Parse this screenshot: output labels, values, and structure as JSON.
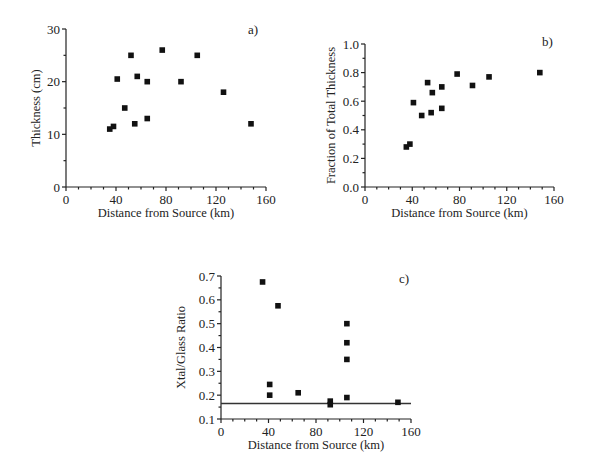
{
  "chart_data": [
    {
      "panel": "a)",
      "type": "scatter",
      "xlabel": "Distance from Source (km)",
      "ylabel": "Thickness (cm)",
      "xlim": [
        0,
        160
      ],
      "ylim": [
        0,
        30
      ],
      "xticks": [
        0,
        40,
        80,
        120,
        160
      ],
      "yticks": [
        0,
        10,
        20,
        30
      ],
      "grid": false,
      "points": [
        {
          "x": 35,
          "y": 11
        },
        {
          "x": 38,
          "y": 11.5
        },
        {
          "x": 41,
          "y": 20.5
        },
        {
          "x": 47,
          "y": 15
        },
        {
          "x": 52,
          "y": 25
        },
        {
          "x": 55,
          "y": 12
        },
        {
          "x": 57,
          "y": 21
        },
        {
          "x": 65,
          "y": 20
        },
        {
          "x": 65,
          "y": 13
        },
        {
          "x": 77,
          "y": 26
        },
        {
          "x": 92,
          "y": 20
        },
        {
          "x": 105,
          "y": 25
        },
        {
          "x": 126,
          "y": 18
        },
        {
          "x": 148,
          "y": 12
        }
      ]
    },
    {
      "panel": "b)",
      "type": "scatter",
      "xlabel": "Distance from Source (km)",
      "ylabel": "Fraction of Total Thickness",
      "xlim": [
        0,
        160
      ],
      "ylim": [
        0,
        1.0
      ],
      "xticks": [
        0,
        40,
        80,
        120,
        160
      ],
      "yticks": [
        "0.0",
        "0.2",
        "0.4",
        "0.6",
        "0.8",
        "1.0"
      ],
      "grid": false,
      "points": [
        {
          "x": 35,
          "y": 0.28
        },
        {
          "x": 38,
          "y": 0.3
        },
        {
          "x": 41,
          "y": 0.59
        },
        {
          "x": 48,
          "y": 0.5
        },
        {
          "x": 53,
          "y": 0.73
        },
        {
          "x": 56,
          "y": 0.52
        },
        {
          "x": 57,
          "y": 0.66
        },
        {
          "x": 65,
          "y": 0.7
        },
        {
          "x": 65,
          "y": 0.55
        },
        {
          "x": 78,
          "y": 0.79
        },
        {
          "x": 91,
          "y": 0.71
        },
        {
          "x": 105,
          "y": 0.77
        },
        {
          "x": 148,
          "y": 0.8
        }
      ]
    },
    {
      "panel": "c)",
      "type": "scatter",
      "xlabel": "Distance from Source (km)",
      "ylabel": "Xtal/Glass Ratio",
      "xlim": [
        0,
        160
      ],
      "ylim": [
        0.1,
        0.7
      ],
      "xticks": [
        0,
        40,
        80,
        120,
        160
      ],
      "yticks": [
        "0.1",
        "0.2",
        "0.3",
        "0.4",
        "0.5",
        "0.6",
        "0.7"
      ],
      "grid": false,
      "reference_line": {
        "y": 0.165,
        "x_from": 0,
        "x_to": 160
      },
      "points": [
        {
          "x": 35,
          "y": 0.675
        },
        {
          "x": 41,
          "y": 0.245
        },
        {
          "x": 41,
          "y": 0.2
        },
        {
          "x": 48,
          "y": 0.575
        },
        {
          "x": 65,
          "y": 0.21
        },
        {
          "x": 92,
          "y": 0.175
        },
        {
          "x": 92,
          "y": 0.16
        },
        {
          "x": 106,
          "y": 0.5
        },
        {
          "x": 106,
          "y": 0.42
        },
        {
          "x": 106,
          "y": 0.35
        },
        {
          "x": 106,
          "y": 0.19
        },
        {
          "x": 149,
          "y": 0.17
        }
      ]
    }
  ],
  "panels": [
    {
      "x0": 66,
      "x1": 266,
      "y0": 187,
      "y1": 29,
      "labelX": 248,
      "labelY": 34,
      "ylabelX": 40
    },
    {
      "x0": 365,
      "x1": 554,
      "y0": 187,
      "y1": 44,
      "labelX": 542,
      "labelY": 46,
      "ylabelX": 335
    },
    {
      "x0": 221,
      "x1": 411,
      "y0": 419,
      "y1": 276,
      "labelX": 399,
      "labelY": 283,
      "ylabelX": 185
    }
  ]
}
